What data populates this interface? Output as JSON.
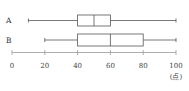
{
  "chart_data": {
    "type": "boxplot",
    "title": "",
    "xlabel": "",
    "unit_label": "(点)",
    "xlim": [
      0,
      100
    ],
    "x_ticks": [
      0,
      20,
      40,
      60,
      80,
      100
    ],
    "x_tick_labels": [
      "0",
      "20",
      "40",
      "60",
      "80",
      "100"
    ],
    "grid": false,
    "series": [
      {
        "name": "A",
        "min": 10,
        "q1": 40,
        "median": 50,
        "q3": 60,
        "max": 100
      },
      {
        "name": "B",
        "min": 20,
        "q1": 40,
        "median": 60,
        "q3": 80,
        "max": 100
      }
    ],
    "colors": {
      "lines": "#555555",
      "axis": "#999999",
      "text": "#333333"
    }
  }
}
